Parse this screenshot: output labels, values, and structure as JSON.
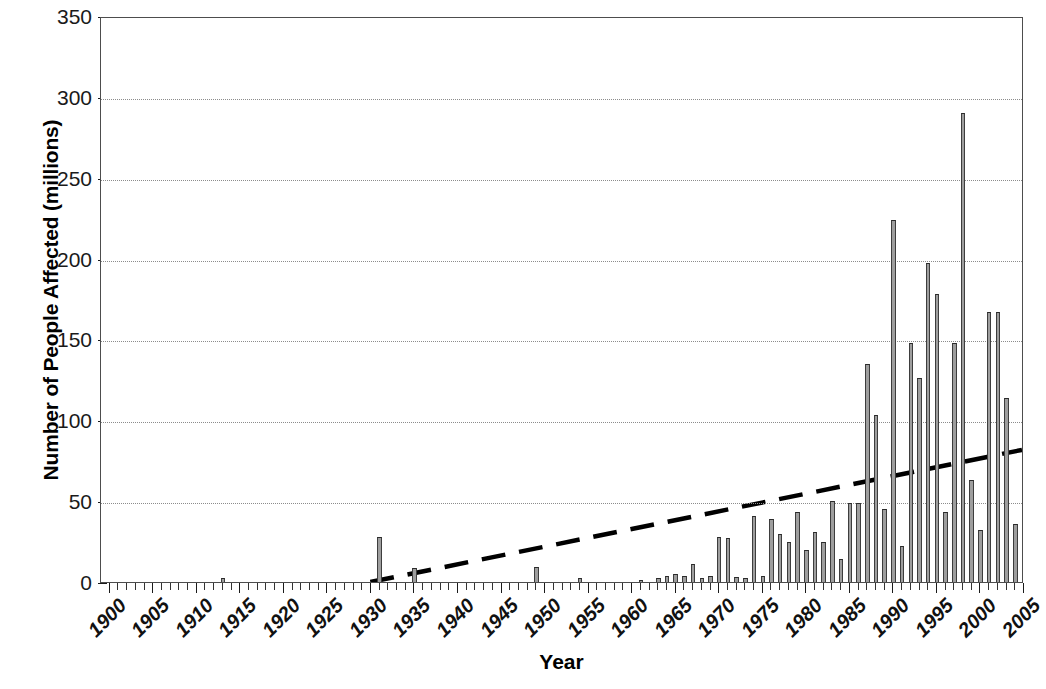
{
  "chart_data": {
    "type": "bar",
    "title": "",
    "xlabel": "Year",
    "ylabel": "Number of People Affected (millions)",
    "xlim": [
      1899,
      2005
    ],
    "ylim": [
      0,
      350
    ],
    "yticks": [
      0,
      50,
      100,
      150,
      200,
      250,
      300,
      350
    ],
    "ytick_labels": [
      "0",
      "50",
      "100",
      "150",
      "200",
      "250",
      "300",
      "350"
    ],
    "xticks": [
      1900,
      1905,
      1910,
      1915,
      1920,
      1925,
      1930,
      1935,
      1940,
      1945,
      1950,
      1955,
      1960,
      1965,
      1970,
      1975,
      1980,
      1985,
      1990,
      1995,
      2000,
      2005
    ],
    "xtick_labels": [
      "1900",
      "1905",
      "1910",
      "1915",
      "1920",
      "1925",
      "1930",
      "1935",
      "1940",
      "1945",
      "1950",
      "1955",
      "1960",
      "1965",
      "1970",
      "1975",
      "1980",
      "1985",
      "1990",
      "1995",
      "2000",
      "2005"
    ],
    "grid": "horizontal-dotted",
    "legend": "none",
    "bar_color": "#9e9e9e",
    "bar_edge_color": "#333333",
    "trendline": {
      "style": "dashed",
      "color": "#000000",
      "x_start": 1930,
      "y_start": 0,
      "x_end": 2005,
      "y_end": 82
    },
    "categories": [
      1900,
      1901,
      1902,
      1903,
      1904,
      1905,
      1906,
      1907,
      1908,
      1909,
      1910,
      1911,
      1912,
      1913,
      1914,
      1915,
      1916,
      1917,
      1918,
      1919,
      1920,
      1921,
      1922,
      1923,
      1924,
      1925,
      1926,
      1927,
      1928,
      1929,
      1930,
      1931,
      1932,
      1933,
      1934,
      1935,
      1936,
      1937,
      1938,
      1939,
      1940,
      1941,
      1942,
      1943,
      1944,
      1945,
      1946,
      1947,
      1948,
      1949,
      1950,
      1951,
      1952,
      1953,
      1954,
      1955,
      1956,
      1957,
      1958,
      1959,
      1960,
      1961,
      1962,
      1963,
      1964,
      1965,
      1966,
      1967,
      1968,
      1969,
      1970,
      1971,
      1972,
      1973,
      1974,
      1975,
      1976,
      1977,
      1978,
      1979,
      1980,
      1981,
      1982,
      1983,
      1984,
      1985,
      1986,
      1987,
      1988,
      1989,
      1990,
      1991,
      1992,
      1993,
      1994,
      1995,
      1996,
      1997,
      1998,
      1999,
      2000,
      2001,
      2002,
      2003,
      2004,
      2005
    ],
    "values": [
      0,
      0,
      0,
      0,
      0,
      0,
      0,
      0,
      0,
      0,
      0,
      0,
      0,
      2.5,
      0,
      0,
      0,
      0,
      0,
      0,
      0,
      0,
      0,
      0,
      0,
      0,
      0,
      0,
      0,
      0,
      0,
      28,
      0,
      0,
      0,
      8.5,
      0,
      0,
      0,
      0,
      0,
      0,
      0,
      0,
      0,
      0,
      0,
      0,
      0,
      9,
      0,
      0,
      0,
      0,
      2.5,
      0,
      0,
      0,
      0,
      0,
      0,
      1.5,
      0,
      2.5,
      4,
      5,
      3.5,
      11,
      2.5,
      4,
      28,
      27,
      3,
      2.5,
      41,
      3.5,
      39,
      30,
      25,
      43,
      20,
      31,
      25,
      50,
      14,
      49,
      49,
      135,
      103,
      45,
      224,
      22,
      148,
      126,
      197,
      178,
      43,
      148,
      290,
      63,
      32,
      167,
      167,
      114,
      36,
      72
    ]
  }
}
